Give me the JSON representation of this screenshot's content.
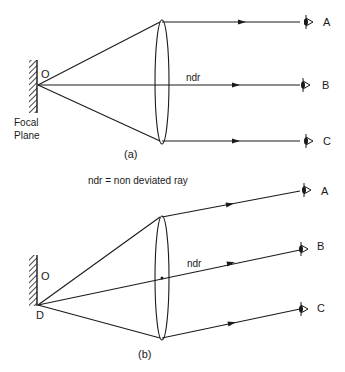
{
  "diagram": {
    "panel_a": {
      "caption": "(a)",
      "source_point_label": "O",
      "focal_plane_label_line1": "Focal",
      "focal_plane_label_line2": "Plane",
      "central_ray_label": "ndr",
      "observers": [
        "A",
        "B",
        "C"
      ]
    },
    "legend": "ndr = non deviated ray",
    "panel_b": {
      "caption": "(b)",
      "center_point_label": "O",
      "source_point_label": "D",
      "central_ray_label": "ndr",
      "observers": [
        "A",
        "B",
        "C"
      ]
    },
    "colors": {
      "ink": "#1a1a1a",
      "background": "#ffffff"
    }
  }
}
